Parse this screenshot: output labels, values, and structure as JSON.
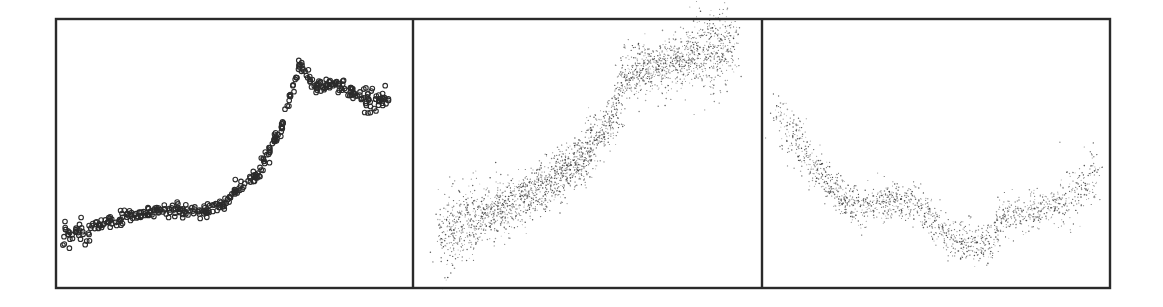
{
  "figure": {
    "title": "",
    "panel_count": 3,
    "colors": {
      "frame": "#2a2a2a",
      "points": "#2b2b2b",
      "background": "#ffffff"
    }
  },
  "chart_data": [
    {
      "type": "scatter",
      "title": "",
      "xlabel": "",
      "ylabel": "",
      "xlim": [
        0,
        1
      ],
      "ylim": [
        0,
        1
      ],
      "grid": false,
      "legend": "none",
      "marker": "open-circle",
      "approx_point_count": 420,
      "spread": 0.012,
      "x": [
        0.017,
        0.07,
        0.14,
        0.263,
        0.34,
        0.417,
        0.47,
        0.5,
        0.56,
        0.6,
        0.635,
        0.655,
        0.686,
        0.7,
        0.726,
        0.76,
        0.796,
        0.83,
        0.866,
        0.9,
        0.936
      ],
      "y": [
        0.186,
        0.205,
        0.24,
        0.283,
        0.29,
        0.279,
        0.31,
        0.364,
        0.42,
        0.513,
        0.6,
        0.7,
        0.836,
        0.81,
        0.755,
        0.76,
        0.755,
        0.73,
        0.71,
        0.705,
        0.706
      ]
    },
    {
      "type": "scatter",
      "title": "",
      "xlabel": "",
      "ylabel": "",
      "xlim": [
        0,
        1
      ],
      "ylim": [
        0,
        1
      ],
      "grid": false,
      "legend": "none",
      "marker": "dot",
      "approx_point_count": 2600,
      "spread": 0.05,
      "x": [
        0.077,
        0.163,
        0.24,
        0.307,
        0.38,
        0.45,
        0.51,
        0.564,
        0.59,
        0.607,
        0.66,
        0.707,
        0.76,
        0.822,
        0.923
      ],
      "y": [
        0.178,
        0.253,
        0.29,
        0.327,
        0.38,
        0.439,
        0.52,
        0.606,
        0.7,
        0.792,
        0.82,
        0.829,
        0.85,
        0.877,
        0.903
      ]
    },
    {
      "type": "scatter",
      "title": "",
      "xlabel": "",
      "ylabel": "",
      "xlim": [
        0,
        1
      ],
      "ylim": [
        0,
        1
      ],
      "grid": false,
      "legend": "none",
      "marker": "dot",
      "approx_point_count": 1500,
      "spread": 0.035,
      "x": [
        0.037,
        0.109,
        0.17,
        0.224,
        0.28,
        0.339,
        0.397,
        0.45,
        0.497,
        0.53,
        0.569,
        0.62,
        0.655,
        0.698,
        0.75,
        0.799,
        0.86,
        0.914,
        0.971
      ],
      "y": [
        0.68,
        0.52,
        0.42,
        0.327,
        0.3,
        0.309,
        0.327,
        0.3,
        0.245,
        0.2,
        0.167,
        0.165,
        0.16,
        0.271,
        0.28,
        0.283,
        0.31,
        0.346,
        0.439
      ]
    }
  ]
}
